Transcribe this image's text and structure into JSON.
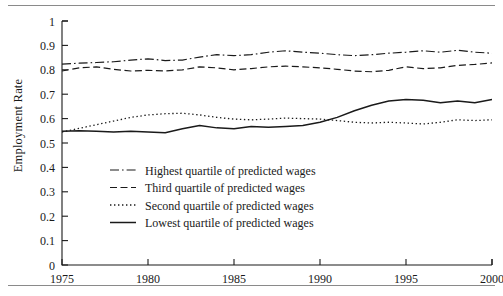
{
  "figure": {
    "ylabel": "Employment Rate",
    "has_top_rule": true,
    "has_bottom_rule": true
  },
  "chart_data": {
    "type": "line",
    "title": "",
    "xlabel": "",
    "ylabel": "Employment Rate",
    "xlim": [
      1975,
      2000
    ],
    "ylim": [
      0,
      1
    ],
    "xticks": [
      1975,
      1980,
      1985,
      1990,
      1995,
      2000
    ],
    "xtick_labels": [
      "1975",
      "1980",
      "1985",
      "1990",
      "1995",
      "2000"
    ],
    "yticks": [
      0,
      0.1,
      0.2,
      0.3,
      0.4,
      0.5,
      0.6,
      0.7,
      0.8,
      0.9,
      1
    ],
    "ytick_labels": [
      "0",
      "0.1",
      "0.2",
      "0.3",
      "0.4",
      "0.5",
      "0.6",
      "0.7",
      "0.8",
      "0.9",
      "1"
    ],
    "grid": false,
    "legend_position": "center-left-inside",
    "line_color": "#1a1a1a",
    "x": [
      1975,
      1976,
      1977,
      1978,
      1979,
      1980,
      1981,
      1982,
      1983,
      1984,
      1985,
      1986,
      1987,
      1988,
      1989,
      1990,
      1991,
      1992,
      1993,
      1994,
      1995,
      1996,
      1997,
      1998,
      1999,
      2000
    ],
    "series": [
      {
        "name": "Highest quartile of predicted wages",
        "style": "dashdot",
        "values": [
          0.823,
          0.827,
          0.83,
          0.833,
          0.84,
          0.845,
          0.838,
          0.84,
          0.852,
          0.862,
          0.858,
          0.862,
          0.872,
          0.878,
          0.872,
          0.868,
          0.862,
          0.858,
          0.862,
          0.868,
          0.872,
          0.878,
          0.872,
          0.88,
          0.872,
          0.868
        ]
      },
      {
        "name": "Third quartile of predicted wages",
        "style": "dashed",
        "values": [
          0.795,
          0.808,
          0.812,
          0.802,
          0.795,
          0.798,
          0.795,
          0.8,
          0.812,
          0.808,
          0.8,
          0.805,
          0.812,
          0.815,
          0.812,
          0.808,
          0.802,
          0.795,
          0.792,
          0.798,
          0.812,
          0.805,
          0.808,
          0.818,
          0.822,
          0.828
        ]
      },
      {
        "name": "Second quartile of predicted wages",
        "style": "dotted",
        "values": [
          0.545,
          0.56,
          0.575,
          0.59,
          0.605,
          0.615,
          0.62,
          0.622,
          0.615,
          0.605,
          0.598,
          0.595,
          0.598,
          0.602,
          0.6,
          0.598,
          0.592,
          0.585,
          0.582,
          0.585,
          0.582,
          0.578,
          0.585,
          0.595,
          0.592,
          0.595
        ]
      },
      {
        "name": "Lowest quartile of predicted wages",
        "style": "solid",
        "values": [
          0.548,
          0.55,
          0.548,
          0.545,
          0.548,
          0.545,
          0.542,
          0.558,
          0.572,
          0.562,
          0.558,
          0.568,
          0.565,
          0.568,
          0.572,
          0.585,
          0.605,
          0.632,
          0.655,
          0.672,
          0.678,
          0.675,
          0.665,
          0.672,
          0.665,
          0.678
        ]
      }
    ]
  },
  "legend": {
    "items": [
      {
        "label": "Highest quartile of predicted wages",
        "style": "dashdot"
      },
      {
        "label": "Third quartile of predicted wages",
        "style": "dashed"
      },
      {
        "label": "Second quartile of predicted wages",
        "style": "dotted"
      },
      {
        "label": "Lowest quartile of predicted wages",
        "style": "solid"
      }
    ]
  }
}
